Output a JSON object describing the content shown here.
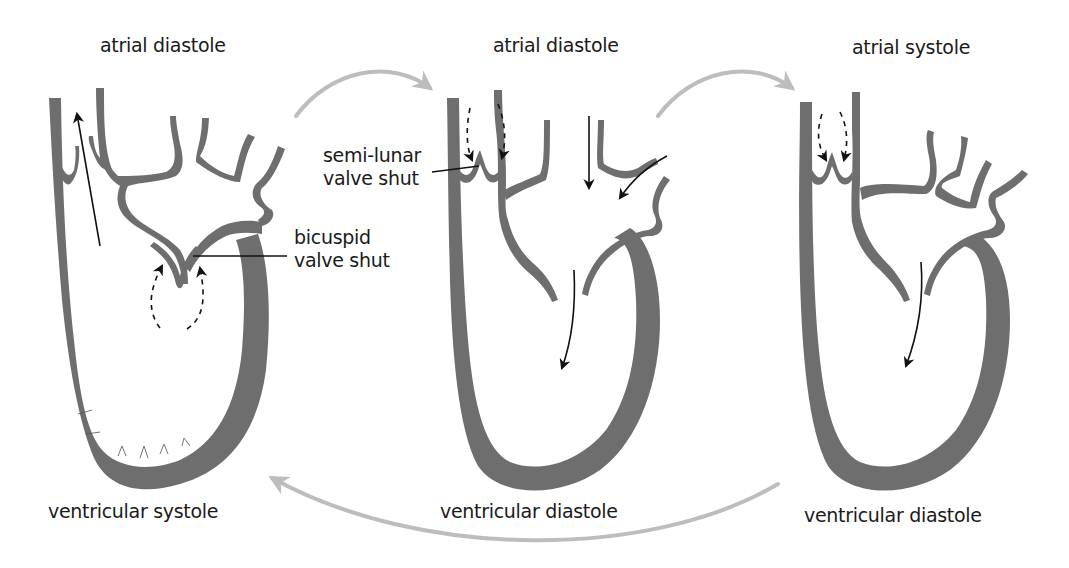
{
  "diagram": {
    "colors": {
      "wall": "#6e6e6e",
      "cycle_arrow": "#bdbdbd",
      "flow_arrow": "#111111",
      "text": "#1a1a1a",
      "background": "#ffffff"
    },
    "panels": [
      {
        "id": "left",
        "atrial_label": "atrial diastole",
        "ventricular_label": "ventricular systole",
        "flow": "blood ejected upward out of ventricle; dashed arrows push bicuspid valve shut"
      },
      {
        "id": "center",
        "atrial_label": "atrial diastole",
        "ventricular_label": "ventricular diastole",
        "flow": "blood enters atrium and flows into ventricle; dashed arrows close semi-lunar valve"
      },
      {
        "id": "right",
        "atrial_label": "atrial systole",
        "ventricular_label": "ventricular diastole",
        "flow": "atrium contracts pushing blood into ventricle; semi-lunar valve shut"
      }
    ],
    "callouts": {
      "semilunar_line1": "semi-lunar",
      "semilunar_line2": "valve shut",
      "bicuspid_line1": "bicuspid",
      "bicuspid_line2": "valve shut"
    },
    "cycle_arrows": [
      {
        "from": "left",
        "to": "center",
        "position": "top"
      },
      {
        "from": "center",
        "to": "right",
        "position": "top"
      },
      {
        "from": "right",
        "to": "left",
        "position": "bottom"
      }
    ]
  }
}
